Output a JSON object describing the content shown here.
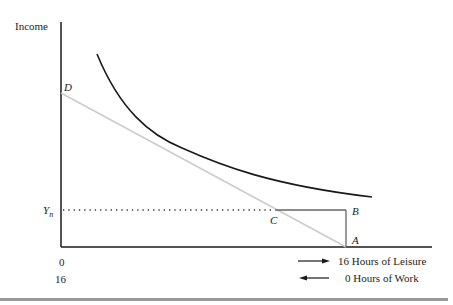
{
  "diagram": {
    "type": "labor-leisure indifference diagram",
    "y_axis_label": "Income",
    "points": {
      "D": "D",
      "C": "C",
      "B": "B",
      "A": "A"
    },
    "y_level_label": "Y",
    "y_level_subscript": "n",
    "x_origin_top": "0",
    "x_origin_bottom": "16",
    "arrow_right_label": "16 Hours of Leisure",
    "arrow_left_label": "0 Hours of Work",
    "colors": {
      "axis": "#1a1a1a",
      "indifference_curve": "#1a1a1a",
      "budget_line": "#cccccc",
      "box_lines": "#666666",
      "dotted": "#333333",
      "bottom_bar": "#9a9a9a"
    }
  }
}
